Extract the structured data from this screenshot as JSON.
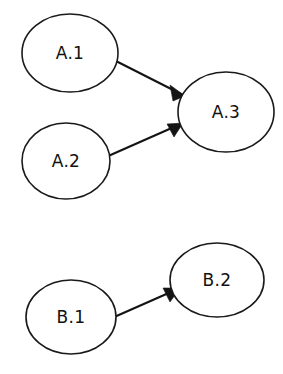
{
  "diagram": {
    "background_color": "#ffffff",
    "stroke_color": "#141414",
    "node_fill_color": "#ffffff",
    "width": 283,
    "height": 374,
    "groups": [
      {
        "id": "A",
        "label": "A",
        "node_ids": [
          "A.1",
          "A.2",
          "A.3"
        ]
      },
      {
        "id": "B",
        "label": "B",
        "node_ids": [
          "B.1",
          "B.2"
        ]
      }
    ],
    "nodes": [
      {
        "id": "A.1",
        "label": "A.1",
        "cx": 70,
        "cy": 53,
        "rx": 48,
        "ry": 39
      },
      {
        "id": "A.2",
        "label": "A.2",
        "cx": 66,
        "cy": 161,
        "rx": 44,
        "ry": 38
      },
      {
        "id": "A.3",
        "label": "A.3",
        "cx": 226,
        "cy": 112,
        "rx": 48,
        "ry": 40
      },
      {
        "id": "B.1",
        "label": "B.1",
        "cx": 71,
        "cy": 317,
        "rx": 45,
        "ry": 37
      },
      {
        "id": "B.2",
        "label": "B.2",
        "cx": 217,
        "cy": 280,
        "rx": 47,
        "ry": 37
      }
    ],
    "edges": [
      {
        "id": "edge-a1-a3",
        "from": "A.1",
        "to": "A.3",
        "label": "",
        "directed": true,
        "x1": 110,
        "y1": 58,
        "x2": 185,
        "y2": 96,
        "arrow_points": "185,96 170,85 173,101"
      },
      {
        "id": "edge-a2-a3",
        "from": "A.2",
        "to": "A.3",
        "label": "",
        "directed": true,
        "x1": 106,
        "y1": 157,
        "x2": 183,
        "y2": 123,
        "arrow_points": "183,123 167,124 174,137"
      },
      {
        "id": "edge-b1-b2",
        "from": "B.1",
        "to": "B.2",
        "label": "",
        "directed": true,
        "x1": 112,
        "y1": 318,
        "x2": 180,
        "y2": 288,
        "arrow_points": "180,288 163,288 170,302"
      }
    ]
  }
}
